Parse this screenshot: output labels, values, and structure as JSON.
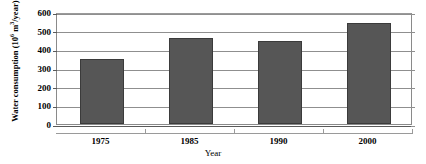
{
  "chart_data": {
    "type": "bar",
    "title": "",
    "categories": [
      "1975",
      "1985",
      "1990",
      "2000"
    ],
    "values": [
      350,
      463,
      447,
      540
    ],
    "series": [
      {
        "name": "Water consumption",
        "values": [
          350,
          463,
          447,
          540
        ]
      }
    ],
    "xlabel": "Year",
    "ylabel": "Water consumption (10⁶ m³/year)",
    "ylabel_parts": {
      "prefix": "Water consumption (10",
      "exponent": "6",
      "middle": " m",
      "unit_exponent": "3",
      "suffix": "/year)"
    },
    "ylim": [
      0,
      600
    ],
    "ytick_labels": [
      "0",
      "100",
      "200",
      "300",
      "400",
      "500",
      "600"
    ],
    "ytick_values": [
      0,
      100,
      200,
      300,
      400,
      500,
      600
    ],
    "grid": "horizontal",
    "legend": "none",
    "bar_color": "#565656",
    "bar_edge_color": "#3b3b3b",
    "grid_color": "#8f8f8f",
    "axis_color": "#5a5a5a",
    "background_color": "#ffffff"
  }
}
